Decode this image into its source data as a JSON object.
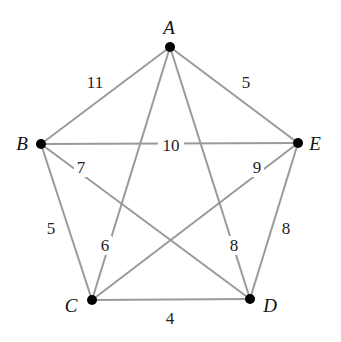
{
  "graph": {
    "type": "complete-weighted-graph",
    "nodes": [
      {
        "id": "A",
        "label": "A",
        "x": 170,
        "y": 47,
        "lx": 169,
        "ly": 34
      },
      {
        "id": "B",
        "label": "B",
        "x": 41,
        "y": 144,
        "lx": 22,
        "ly": 150
      },
      {
        "id": "C",
        "label": "C",
        "x": 92,
        "y": 300,
        "lx": 71,
        "ly": 312
      },
      {
        "id": "D",
        "label": "D",
        "x": 250,
        "y": 299,
        "lx": 270,
        "ly": 312
      },
      {
        "id": "E",
        "label": "E",
        "x": 298,
        "y": 143,
        "lx": 315,
        "ly": 150
      }
    ],
    "edges": [
      {
        "from": "A",
        "to": "B",
        "weight": "11",
        "wx": 95,
        "wy": 88,
        "gap": false
      },
      {
        "from": "A",
        "to": "E",
        "weight": "5",
        "wx": 246,
        "wy": 88,
        "gap": false
      },
      {
        "from": "A",
        "to": "C",
        "weight": "6",
        "wx": 105,
        "wy": 251,
        "gap": true
      },
      {
        "from": "A",
        "to": "D",
        "weight": "8",
        "wx": 234,
        "wy": 251,
        "gap": true
      },
      {
        "from": "B",
        "to": "E",
        "weight": "10",
        "wx": 171,
        "wy": 151,
        "gap": true
      },
      {
        "from": "B",
        "to": "D",
        "weight": "7",
        "wx": 81,
        "wy": 173,
        "gap": true
      },
      {
        "from": "B",
        "to": "C",
        "weight": "5",
        "wx": 51,
        "wy": 234,
        "gap": false
      },
      {
        "from": "E",
        "to": "C",
        "weight": "9",
        "wx": 257,
        "wy": 173,
        "gap": true
      },
      {
        "from": "E",
        "to": "D",
        "weight": "8",
        "wx": 286,
        "wy": 234,
        "gap": false
      },
      {
        "from": "C",
        "to": "D",
        "weight": "4",
        "wx": 170,
        "wy": 324,
        "gap": false
      }
    ]
  }
}
